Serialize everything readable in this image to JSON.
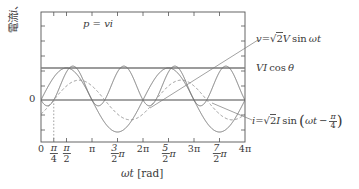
{
  "figure": {
    "axis_color": "#555555",
    "curve_color": "#6e6e6e",
    "dash_color": "#8a8a8a",
    "background": "#ffffff"
  },
  "labels": {
    "ylabel": "電流 i、電圧 v、電力 p",
    "ylabel_parts": [
      "電流",
      "i",
      "、電圧",
      "v",
      "、電力",
      "p"
    ],
    "xlabel_sym": "ωt",
    "xlabel_unit": "[rad]",
    "zero_tick": "0",
    "power_label": "p = vi",
    "voltage_label": "v = √2 V sin ωt",
    "avg_power_label": "VI cos θ",
    "current_label": "i = √2 I sin(ωt − π/4)"
  },
  "xticks": [
    {
      "value": 0.0,
      "label": "0",
      "num": "",
      "den": "",
      "suffix": ""
    },
    {
      "value": 0.25,
      "label": "frac",
      "num": "π",
      "den": "4",
      "suffix": ""
    },
    {
      "value": 0.5,
      "label": "frac",
      "num": "π",
      "den": "2",
      "suffix": ""
    },
    {
      "value": 1.0,
      "label": "π",
      "num": "",
      "den": "",
      "suffix": ""
    },
    {
      "value": 1.5,
      "label": "frac",
      "num": "3",
      "den": "2",
      "suffix": "π"
    },
    {
      "value": 2.0,
      "label": "2π",
      "num": "",
      "den": "",
      "suffix": ""
    },
    {
      "value": 2.5,
      "label": "frac",
      "num": "5",
      "den": "2",
      "suffix": "π"
    },
    {
      "value": 3.0,
      "label": "3π",
      "num": "",
      "den": "",
      "suffix": ""
    },
    {
      "value": 3.5,
      "label": "frac",
      "num": "7",
      "den": "2",
      "suffix": "π"
    },
    {
      "value": 4.0,
      "label": "4π",
      "num": "",
      "den": "",
      "suffix": ""
    }
  ],
  "chart_data": {
    "type": "line",
    "title": "",
    "xlabel": "ωt [rad]",
    "ylabel": "電流 i、電圧 v、電力 p",
    "xlim": [
      0,
      12.566370614
    ],
    "xlim_pi": [
      0,
      4
    ],
    "ylim": [
      -1.6,
      2.25
    ],
    "grid": false,
    "legend": "annotations",
    "phase_shift_rad": 0.7853981634,
    "phase_shift_label": "π/4",
    "amplitude_voltage": 1.0,
    "amplitude_current": 0.62,
    "power_offset": 0.62,
    "avg_power_value": 0.62,
    "series": [
      {
        "name": "v = √2 V sin ωt",
        "type": "sine",
        "style": "solid",
        "amplitude": 1.0,
        "phase": 0.0,
        "offset": 0.0,
        "color": "#6e6e6e",
        "samples_pi": [
          0,
          0.5,
          1.0,
          1.5,
          2.0,
          2.5,
          3.0,
          3.5,
          4.0
        ],
        "samples_y": [
          0,
          1.0,
          0,
          -1.0,
          0,
          1.0,
          0,
          -1.0,
          0
        ]
      },
      {
        "name": "i = √2 I sin(ωt − π/4)",
        "type": "sine",
        "style": "dashed",
        "amplitude": 0.62,
        "phase": -0.7853981634,
        "offset": 0.0,
        "color": "#8a8a8a",
        "samples_pi": [
          0,
          0.25,
          0.75,
          1.25,
          1.75,
          2.25,
          2.75,
          3.25,
          3.75,
          4.0
        ],
        "samples_y": [
          -0.438,
          0,
          0.62,
          0,
          -0.62,
          0,
          0.62,
          0,
          -0.62,
          -0.438
        ]
      },
      {
        "name": "p = vi",
        "type": "product",
        "style": "solid",
        "amplitude": 1.24,
        "offset": 0.62,
        "color": "#6e6e6e",
        "peak_value": 1.5,
        "min_value": -0.26,
        "samples_pi": [
          0,
          0.25,
          0.625,
          1.0,
          1.125,
          1.625,
          2.0,
          2.125,
          2.625
        ],
        "samples_y": [
          0,
          0,
          1.5,
          0,
          -0.26,
          1.5,
          0,
          -0.26,
          1.5
        ]
      },
      {
        "name": "VI cos θ",
        "type": "hline",
        "style": "solid",
        "value": 0.62,
        "color": "#777777"
      }
    ],
    "annotations": [
      {
        "text": "p = vi",
        "x_pi": 0.95,
        "y": 1.72,
        "leader": false
      },
      {
        "text": "v = √2 V sin ωt",
        "x_pi": 4.15,
        "y": 1.3,
        "leader": true
      },
      {
        "text": "VI cos θ",
        "x_pi": 4.15,
        "y": 0.62,
        "leader": false
      },
      {
        "text": "i = √2 I sin(ωt − π/4)",
        "x_pi": 4.15,
        "y": -0.55,
        "leader": true
      },
      {
        "text": "π/4 dotted marker",
        "x_pi": 0.25,
        "y": -1.6,
        "leader": false
      }
    ]
  }
}
